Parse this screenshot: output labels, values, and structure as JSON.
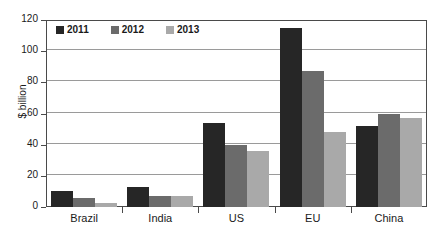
{
  "chart_data": {
    "type": "bar",
    "title": "",
    "xlabel": "",
    "ylabel": "$ billion",
    "ylim": [
      0,
      120
    ],
    "yticks": [
      0,
      20,
      40,
      60,
      80,
      100,
      120
    ],
    "ytick_labels": [
      "0",
      "20",
      "40",
      "60",
      "80",
      "100",
      "120"
    ],
    "grid": true,
    "legend_position": "top-left",
    "categories": [
      "Brazil",
      "India",
      "US",
      "EU",
      "China"
    ],
    "series": [
      {
        "name": "2011",
        "color": "#262626",
        "values": [
          10,
          13,
          54,
          115,
          52
        ]
      },
      {
        "name": "2012",
        "color": "#6b6b6b",
        "values": [
          6,
          7,
          40,
          87,
          60
        ]
      },
      {
        "name": "2013",
        "color": "#a9a9a9",
        "values": [
          2.5,
          7,
          36,
          48,
          57
        ]
      }
    ]
  }
}
